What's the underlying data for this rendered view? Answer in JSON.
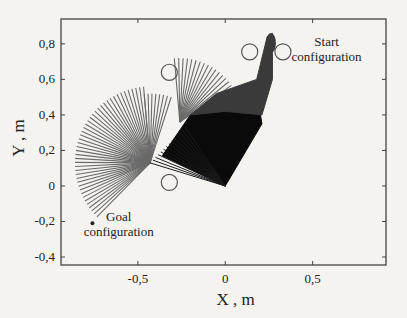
{
  "chart_data": {
    "type": "line",
    "title": "",
    "xlabel": "X ,  m",
    "ylabel": "Y ,  m",
    "xlim": [
      -0.94,
      0.92
    ],
    "ylim": [
      -0.445,
      0.94
    ],
    "grid": false,
    "x_ticks": [
      {
        "value": -0.5,
        "label": "-0,5"
      },
      {
        "value": 0,
        "label": "0"
      },
      {
        "value": 0.5,
        "label": "0,5"
      }
    ],
    "y_ticks": [
      {
        "value": 0.8,
        "label": "0,8"
      },
      {
        "value": 0.6,
        "label": "0,6"
      },
      {
        "value": 0.4,
        "label": "0,4"
      },
      {
        "value": 0.2,
        "label": "0,2"
      },
      {
        "value": 0,
        "label": "0"
      },
      {
        "value": -0.2,
        "label": "-0,2"
      },
      {
        "value": -0.4,
        "label": "-0,4"
      }
    ],
    "obstacles": [
      {
        "x": -0.32,
        "y": 0.64,
        "r": 0.046
      },
      {
        "x": 0.14,
        "y": 0.755,
        "r": 0.046
      },
      {
        "x": 0.33,
        "y": 0.755,
        "r": 0.046
      },
      {
        "x": -0.32,
        "y": 0.02,
        "r": 0.046
      }
    ],
    "manipulator": {
      "base": {
        "x": 0,
        "y": 0
      },
      "start_tip": {
        "x": 0.25,
        "y": 0.85
      },
      "goal_tip": {
        "x": -0.76,
        "y": -0.21
      }
    },
    "sweep_regions": [
      {
        "name": "base-link-sweep",
        "shade": "black",
        "points": [
          [
            0,
            0
          ],
          [
            -0.36,
            0.17
          ],
          [
            -0.2,
            0.4
          ],
          [
            0.0,
            0.42
          ],
          [
            0.2,
            0.41
          ],
          [
            0.21,
            0.35
          ]
        ]
      },
      {
        "name": "elbow-link-sweep",
        "shade": "darkgray",
        "points": [
          [
            -0.2,
            0.4
          ],
          [
            -0.05,
            0.52
          ],
          [
            0.18,
            0.6
          ],
          [
            0.24,
            0.84
          ],
          [
            0.27,
            0.86
          ],
          [
            0.27,
            0.6
          ],
          [
            0.21,
            0.4
          ],
          [
            0.0,
            0.42
          ]
        ]
      }
    ],
    "fans": [
      {
        "name": "goal-fan",
        "pivot": {
          "x": -0.43,
          "y": 0.13
        },
        "length": 0.43,
        "angle_start_deg": 225,
        "angle_end_deg": 95,
        "count": 44,
        "shade": "gray"
      },
      {
        "name": "middle-fan",
        "pivot": {
          "x": -0.26,
          "y": 0.36
        },
        "length": 0.36,
        "angle_start_deg": 95,
        "angle_end_deg": 35,
        "count": 16,
        "shade": "gray"
      },
      {
        "name": "left-vertical-fan",
        "pivot": {
          "x": -0.43,
          "y": 0.13
        },
        "length": 0.39,
        "angle_start_deg": 95,
        "angle_end_deg": 72,
        "count": 8,
        "shade": "gray"
      }
    ],
    "annotations": [
      {
        "text_lines": [
          "Start",
          "configuration"
        ],
        "x": 0.58,
        "y": 0.79
      },
      {
        "text_lines": [
          "Goal",
          "configuration"
        ],
        "x": -0.61,
        "y": -0.2
      }
    ]
  }
}
